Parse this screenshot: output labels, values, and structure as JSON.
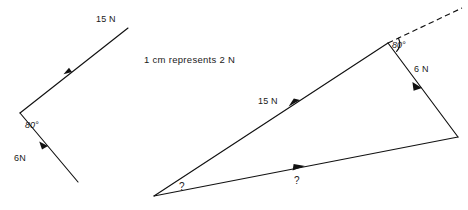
{
  "figure": {
    "title": "",
    "background_color": "#ffffff",
    "ink_color": "#111111",
    "scale_note": "1 cm  represents  2 N",
    "left_diagram": {
      "name": "given-forces",
      "vertex": {
        "x": 20,
        "y": 113
      },
      "vectors": [
        {
          "label": "15 N",
          "magnitude": 15,
          "unit": "N",
          "from": {
            "x": 20,
            "y": 113
          },
          "to": {
            "x": 128,
            "y": 28
          },
          "arrow_at": {
            "x": 72,
            "y": 72
          },
          "label_pos": {
            "x": 96,
            "y": 22
          }
        },
        {
          "label": "6N",
          "magnitude": 6,
          "unit": "N",
          "from": {
            "x": 20,
            "y": 113
          },
          "to": {
            "x": 78,
            "y": 182
          },
          "arrow_at": {
            "x": 46,
            "y": 144
          },
          "label_pos": {
            "x": 14,
            "y": 159
          }
        }
      ],
      "angle": {
        "label": "80°",
        "value": 80,
        "unit": "deg",
        "label_pos": {
          "x": 26,
          "y": 127
        }
      }
    },
    "right_diagram": {
      "name": "force-triangle",
      "vertices": {
        "apex_left": {
          "x": 154,
          "y": 196
        },
        "top": {
          "x": 388,
          "y": 43
        },
        "right": {
          "x": 458,
          "y": 137
        }
      },
      "sides": [
        {
          "label": "15 N",
          "magnitude": 15,
          "unit": "N",
          "from": {
            "x": 154,
            "y": 196
          },
          "to": {
            "x": 388,
            "y": 43
          },
          "arrow_at": {
            "x": 296,
            "y": 103
          },
          "label_pos": {
            "x": 260,
            "y": 101
          }
        },
        {
          "label": "6 N",
          "magnitude": 6,
          "unit": "N",
          "from": {
            "x": 388,
            "y": 43
          },
          "to": {
            "x": 458,
            "y": 137
          },
          "arrow_at": {
            "x": 419,
            "y": 85
          },
          "label_pos": {
            "x": 415,
            "y": 70
          }
        },
        {
          "label": "?",
          "magnitude": null,
          "unit": "N",
          "from": {
            "x": 154,
            "y": 196
          },
          "to": {
            "x": 458,
            "y": 137
          },
          "arrow_at": {
            "x": 300,
            "y": 168
          },
          "label_pos": {
            "x": 297,
            "y": 183
          }
        }
      ],
      "dashed_extension": {
        "name": "construction-line",
        "from": {
          "x": 388,
          "y": 43
        },
        "to": {
          "x": 462,
          "y": 8
        }
      },
      "angle_known": {
        "label": "80°",
        "value": 80,
        "unit": "deg",
        "label_pos": {
          "x": 393,
          "y": 48
        }
      },
      "angle_unknown": {
        "label": "?",
        "value": null,
        "unit": "deg",
        "label_pos": {
          "x": 182,
          "y": 188
        }
      }
    }
  }
}
